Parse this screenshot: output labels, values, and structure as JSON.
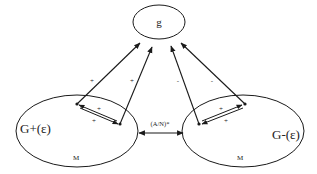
{
  "diagram": {
    "top_node": {
      "label": "g"
    },
    "left_node": {
      "label": "G+(ε)",
      "sublabel": "M"
    },
    "right_node": {
      "label": "G-(ε)",
      "sublabel": "M"
    },
    "middle_edge": {
      "label": "(A/N)*"
    },
    "edge_labels": {
      "left_outer": "+",
      "left_inner": "+",
      "right_inner": "-",
      "right_outer": "-",
      "left_pair_top": "+",
      "left_pair_bottom": "+",
      "right_pair_top": "+",
      "right_pair_bottom": "+"
    },
    "colors": {
      "stroke": "#1a1a1a",
      "background": "#ffffff"
    }
  }
}
